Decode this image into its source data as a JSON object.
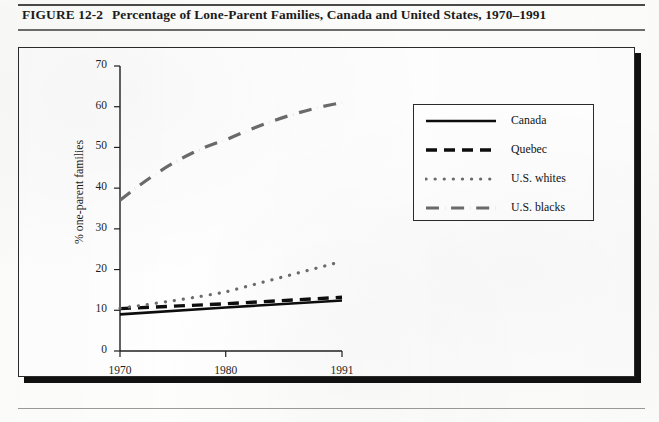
{
  "figure": {
    "number": "FIGURE 12-2",
    "title": "Percentage of Lone-Parent Families, Canada and United States, 1970–1991"
  },
  "chart_data": {
    "type": "line",
    "title": "Percentage of Lone-Parent Families, Canada and United States, 1970–1991",
    "xlabel": "",
    "ylabel": "% one-parent families",
    "x": [
      1970,
      1980,
      1991
    ],
    "xtick_labels": [
      "1970",
      "1980",
      "1991"
    ],
    "xlim": [
      1970,
      1991
    ],
    "ylim": [
      0,
      70
    ],
    "ytick_labels": [
      "0",
      "10",
      "20",
      "30",
      "40",
      "50",
      "60",
      "70"
    ],
    "yticks": [
      0,
      10,
      20,
      30,
      40,
      50,
      60,
      70
    ],
    "grid": false,
    "legend_position": "upper right",
    "series": [
      {
        "name": "Canada",
        "style": "solid",
        "color": "#0d0d0d",
        "values": [
          9.0,
          10.7,
          12.4
        ]
      },
      {
        "name": "Quebec",
        "style": "dashed",
        "color": "#0d0d0d",
        "values": [
          10.4,
          11.6,
          13.2
        ]
      },
      {
        "name": "U.S. whites",
        "style": "dotted",
        "color": "#6b6b6b",
        "values": [
          10.5,
          14.5,
          22.0
        ]
      },
      {
        "name": "U.S. blacks",
        "style": "dash-dot",
        "color": "#6b6b6b",
        "values": [
          37.0,
          51.8,
          61.0
        ]
      }
    ]
  },
  "legend": {
    "items": [
      {
        "label": "Canada"
      },
      {
        "label": "Quebec"
      },
      {
        "label": "U.S. whites"
      },
      {
        "label": "U.S. blacks"
      }
    ]
  }
}
